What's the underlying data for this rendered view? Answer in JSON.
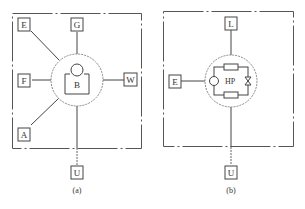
{
  "panel_a": {
    "caption": "(a)",
    "center_label": "B",
    "nodes": {
      "E": "E",
      "G": "G",
      "F": "F",
      "W": "W",
      "A": "A",
      "U": "U"
    }
  },
  "panel_b": {
    "caption": "(b)",
    "center_label": "HP",
    "nodes": {
      "L": "L",
      "E": "E",
      "U": "U"
    }
  },
  "colors": {
    "line": "#444444",
    "dashed": "#999999",
    "background": "#ffffff"
  }
}
